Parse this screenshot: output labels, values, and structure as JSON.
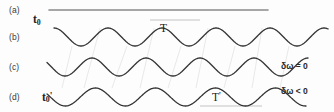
{
  "figure": {
    "background_color": "#fdfdfd",
    "wave_color": "#333333",
    "line_color": "#8a8a8a",
    "guide_color": "#e9e9e9",
    "bracket_color": "#e0e0e0",
    "row_labels": [
      {
        "id": "a",
        "text": "(a)"
      },
      {
        "id": "b",
        "text": "(b)"
      },
      {
        "id": "c",
        "text": "(c)"
      },
      {
        "id": "d",
        "text": "(d)"
      }
    ],
    "annotations": {
      "t0": "t",
      "t0_sub": "0",
      "t0_prime": "t",
      "t0_prime_sub": "0",
      "t0_prime_mark": "'",
      "period_T": "T",
      "period_T_prime": "T",
      "period_T_prime_mark": "'"
    },
    "conditions": [
      {
        "id": "c",
        "text": "δω = 0"
      },
      {
        "id": "d",
        "text": "δω < 0"
      }
    ]
  },
  "chart_data": {
    "type": "line",
    "title": "",
    "xlabel": "",
    "ylabel": "",
    "grid": false,
    "legend": "none",
    "traces": [
      {
        "id": "a",
        "label": "(a)",
        "kind": "straight-line",
        "x_start": 49,
        "x_end": 268,
        "y": 10,
        "amplitude": 0,
        "period": 0,
        "phase_deg": 0,
        "color": "#8a8a8a",
        "stroke_width": 1.6
      },
      {
        "id": "b",
        "label": "(b)",
        "kind": "sine",
        "x_start": 54,
        "x_end": 328,
        "baseline_y": 37,
        "amplitude": 9,
        "period": 54,
        "phase_deg": 90,
        "cycles": 5.07,
        "color": "#333333",
        "stroke_width": 1.3,
        "start_marker": "t0",
        "period_marker": "T"
      },
      {
        "id": "c",
        "label": "(c)",
        "kind": "sine",
        "x_start": 47,
        "x_end": 308,
        "baseline_y": 67,
        "amplitude": 9,
        "period": 54,
        "phase_deg": 150,
        "cycles": 4.83,
        "color": "#333333",
        "stroke_width": 1.3,
        "condition": "δω = 0"
      },
      {
        "id": "d",
        "label": "(d)",
        "kind": "sine",
        "x_start": 47,
        "x_end": 306,
        "baseline_y": 97,
        "amplitude": 9,
        "period": 60,
        "phase_deg": 160,
        "cycles": 4.32,
        "color": "#333333",
        "stroke_width": 1.3,
        "start_marker": "t0'",
        "period_marker": "T'",
        "condition": "δω < 0"
      }
    ],
    "period_brackets": [
      {
        "for": "b",
        "x_start": 150,
        "x_end": 200,
        "y": 20,
        "label": "T"
      },
      {
        "for": "d",
        "x_start": 200,
        "x_end": 262,
        "y": 106,
        "label": "T'"
      }
    ],
    "guide_lines": [
      {
        "x1": 72,
        "y1": 46,
        "x2": 62,
        "y2": 88
      },
      {
        "x1": 100,
        "y1": 28,
        "x2": 84,
        "y2": 88
      },
      {
        "x1": 127,
        "y1": 46,
        "x2": 112,
        "y2": 88
      },
      {
        "x1": 154,
        "y1": 28,
        "x2": 140,
        "y2": 88
      },
      {
        "x1": 181,
        "y1": 46,
        "x2": 168,
        "y2": 88
      },
      {
        "x1": 208,
        "y1": 28,
        "x2": 196,
        "y2": 88
      },
      {
        "x1": 235,
        "y1": 46,
        "x2": 224,
        "y2": 88
      },
      {
        "x1": 262,
        "y1": 28,
        "x2": 252,
        "y2": 88
      },
      {
        "x1": 289,
        "y1": 46,
        "x2": 280,
        "y2": 88
      }
    ]
  }
}
